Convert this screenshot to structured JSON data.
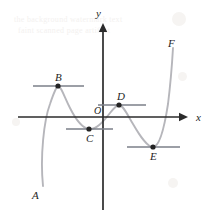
{
  "figure": {
    "kind": "cartesian-curve-diagram",
    "width": 211,
    "height": 216,
    "background_color": "#ffffff",
    "curve_color": "#b6b6bb",
    "axis_color": "#2b2b2b",
    "tangent_color": "#7b7f88",
    "point_color": "#232323"
  },
  "axes": {
    "x_label": "x",
    "y_label": "y",
    "origin_label": "O",
    "x_axis": {
      "y": 117,
      "x_start": 18,
      "x_end": 188,
      "arrow": "right"
    },
    "y_axis": {
      "x": 103,
      "y_start": 210,
      "y_end": 23,
      "arrow": "up"
    },
    "x_label_pos": {
      "x": 196,
      "y": 112
    },
    "y_label_pos": {
      "x": 96,
      "y": 8
    },
    "origin_label_pos": {
      "x": 94,
      "y": 106
    }
  },
  "curve": {
    "name": "f",
    "endpoint_start_label": "A",
    "endpoint_end_label": "F",
    "endpoint_start_pos": {
      "x": 34,
      "y": 190
    },
    "endpoint_end_pos": {
      "x": 170,
      "y": 40
    },
    "path": "M 43,186 C 40,156 44,120 50,104 C 54,92 57,86 58,86 C 61,86 64,96 70,108 C 76,120 82,128 89,129 C 96,130 103,122 110,113 C 114,108 117,105 119,105 C 123,105 127,114 133,124 C 140,136 147,147 153,147 C 159,147 164,130 168,104 C 170,88 172,65 173,48"
  },
  "points": [
    {
      "label": "A",
      "role": "curve-endpoint-lower-left",
      "x": 43,
      "y": 186,
      "label_x": 32,
      "label_y": 190,
      "has_dot": false,
      "has_tangent": false
    },
    {
      "label": "B",
      "role": "local-maximum",
      "x": 58,
      "y": 86,
      "label_x": 55,
      "label_y": 72,
      "has_dot": true,
      "has_tangent": true,
      "tangent_x1": 33,
      "tangent_x2": 84,
      "tangent_y": 86
    },
    {
      "label": "C",
      "role": "local-minimum",
      "x": 89,
      "y": 129,
      "label_x": 86,
      "label_y": 133,
      "has_dot": true,
      "has_tangent": true,
      "tangent_x1": 66,
      "tangent_x2": 113,
      "tangent_y": 129
    },
    {
      "label": "D",
      "role": "local-maximum",
      "x": 119,
      "y": 105,
      "label_x": 117,
      "label_y": 91,
      "has_dot": true,
      "has_tangent": true,
      "tangent_x1": 98,
      "tangent_x2": 146,
      "tangent_y": 105
    },
    {
      "label": "E",
      "role": "local-minimum",
      "x": 153,
      "y": 147,
      "label_x": 150,
      "label_y": 151,
      "has_dot": true,
      "has_tangent": true,
      "tangent_x1": 127,
      "tangent_x2": 180,
      "tangent_y": 147
    },
    {
      "label": "F",
      "role": "curve-endpoint-upper-right",
      "x": 173,
      "y": 48,
      "label_x": 168,
      "label_y": 38,
      "has_dot": false,
      "has_tangent": false
    }
  ],
  "watermark": {
    "line1": "the background watermark text",
    "line2": "faint scanned page artifact",
    "line1_pos": {
      "x": 14,
      "y": 14
    },
    "line2_pos": {
      "x": 18,
      "y": 25
    }
  }
}
